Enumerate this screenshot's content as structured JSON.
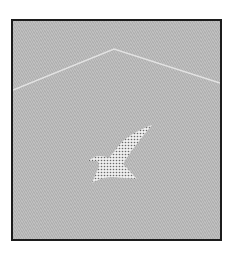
{
  "illustration": {
    "description": "Gray textured panel with a light peaked line and a dotted bird silhouette",
    "colors": {
      "background": "#b9b9b9",
      "border": "#1c1c1c",
      "peak_line": "#e2e2e2",
      "bird_fill": "#eeeeee",
      "bird_dots": "#6a6a6a"
    },
    "peak_line": {
      "left": [
        0,
        69
      ],
      "apex": [
        101,
        28
      ],
      "right": [
        207,
        62
      ]
    },
    "bird": {
      "center": [
        100,
        130
      ],
      "shape": "bird-in-flight"
    }
  }
}
